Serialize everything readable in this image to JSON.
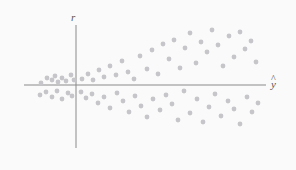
{
  "figure": {
    "background_color": "#fafafa",
    "width": 296,
    "height": 170,
    "axis_color": "#8a8a8a",
    "point_color": "#c6c6ca",
    "label_color": "#555555"
  },
  "labels": {
    "y_axis": "r",
    "x_axis_base": "y",
    "x_axis_accent": "^",
    "x_axis_full": "ŷ"
  },
  "chart_data": {
    "type": "scatter",
    "title": "",
    "subtitle": "",
    "xlabel": "ŷ",
    "ylabel": "r",
    "grid": false,
    "legend": null,
    "axes": {
      "origin_px": [
        76,
        85
      ],
      "x_axis_px": {
        "x1": 24,
        "x2": 266,
        "y": 85
      },
      "y_axis_px": {
        "x": 76,
        "y1": 25,
        "y2": 148
      },
      "xlim": [
        -1.1,
        4.3
      ],
      "ylim": [
        -1.35,
        1.35
      ],
      "x_units_per_px": 0.0222,
      "y_units_per_px": 0.0222
    },
    "n_points": 72,
    "points_px": [
      [
        41,
        83
      ],
      [
        47,
        78
      ],
      [
        52,
        80
      ],
      [
        55,
        76
      ],
      [
        58,
        82
      ],
      [
        62,
        78
      ],
      [
        66,
        81
      ],
      [
        71,
        75
      ],
      [
        74,
        80
      ],
      [
        40,
        95
      ],
      [
        46,
        92
      ],
      [
        52,
        97
      ],
      [
        57,
        91
      ],
      [
        62,
        99
      ],
      [
        68,
        93
      ],
      [
        72,
        96
      ],
      [
        82,
        79
      ],
      [
        88,
        74
      ],
      [
        93,
        80
      ],
      [
        99,
        70
      ],
      [
        104,
        77
      ],
      [
        110,
        66
      ],
      [
        116,
        75
      ],
      [
        122,
        61
      ],
      [
        128,
        72
      ],
      [
        134,
        79
      ],
      [
        140,
        56
      ],
      [
        147,
        69
      ],
      [
        152,
        50
      ],
      [
        158,
        74
      ],
      [
        163,
        44
      ],
      [
        81,
        92
      ],
      [
        86,
        98
      ],
      [
        92,
        94
      ],
      [
        98,
        103
      ],
      [
        104,
        97
      ],
      [
        110,
        108
      ],
      [
        117,
        93
      ],
      [
        123,
        101
      ],
      [
        129,
        112
      ],
      [
        135,
        96
      ],
      [
        141,
        106
      ],
      [
        147,
        117
      ],
      [
        153,
        99
      ],
      [
        169,
        59
      ],
      [
        174,
        40
      ],
      [
        180,
        68
      ],
      [
        185,
        48
      ],
      [
        190,
        33
      ],
      [
        196,
        63
      ],
      [
        201,
        42
      ],
      [
        207,
        52
      ],
      [
        212,
        30
      ],
      [
        218,
        45
      ],
      [
        223,
        66
      ],
      [
        229,
        36
      ],
      [
        234,
        57
      ],
      [
        240,
        32
      ],
      [
        245,
        49
      ],
      [
        251,
        41
      ],
      [
        256,
        62
      ],
      [
        160,
        110
      ],
      [
        166,
        95
      ],
      [
        172,
        104
      ],
      [
        178,
        120
      ],
      [
        184,
        91
      ],
      [
        190,
        113
      ],
      [
        197,
        99
      ],
      [
        203,
        122
      ],
      [
        209,
        107
      ],
      [
        215,
        94
      ],
      [
        221,
        116
      ],
      [
        228,
        101
      ],
      [
        234,
        109
      ],
      [
        240,
        124
      ],
      [
        247,
        97
      ],
      [
        252,
        112
      ],
      [
        258,
        103
      ]
    ]
  }
}
